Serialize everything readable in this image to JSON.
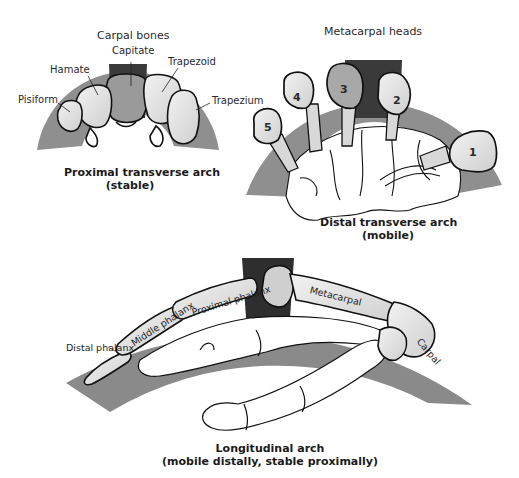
{
  "figure": {
    "panels": [
      {
        "id": "proximal",
        "header": "Carpal bones",
        "title_line1": "Proximal transverse arch",
        "title_line2": "(stable)",
        "labels": {
          "capitate": "Capitate",
          "hamate": "Hamate",
          "pisiform": "Pisiform",
          "trapezoid": "Trapezoid",
          "trapezium": "Trapezium"
        }
      },
      {
        "id": "distal",
        "header": "Metacarpal heads",
        "title_line1": "Distal transverse arch",
        "title_line2": "(mobile)",
        "metacarpal_numbers": [
          "1",
          "2",
          "3",
          "4",
          "5"
        ]
      },
      {
        "id": "longitudinal",
        "title_line1": "Longitudinal arch",
        "title_line2": "(mobile distally, stable proximally)",
        "labels": {
          "distal_phalanx": "Distal phalanx",
          "middle_phalanx": "Middle phalanx",
          "proximal_phalanx": "Proximal phalanx",
          "metacarpal": "Metacarpal",
          "carpal": "Carpal"
        }
      }
    ],
    "colors": {
      "arch_band": "#8a8a8a",
      "keystone": "#2a2a2a",
      "bone_fill": "#e6e6e6",
      "outline": "#111111"
    }
  }
}
